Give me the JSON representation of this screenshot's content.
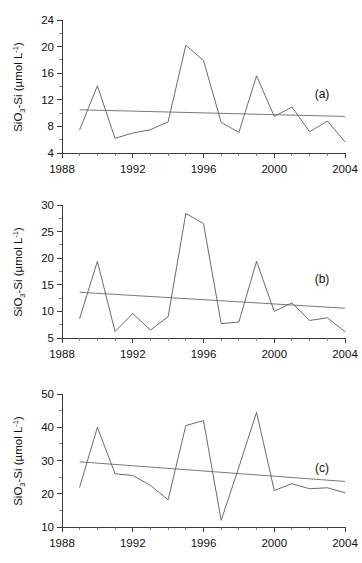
{
  "figure": {
    "background": "#ffffff",
    "line_color": "#5a5a5a",
    "trend_color": "#6a6a6a",
    "axis_color": "#3a3a3a"
  },
  "axis_title": {
    "prefix": "SiO",
    "subscript": "3",
    "middle": "-Si (µmol L",
    "superscript": "-1",
    "suffix": ")",
    "full": "SiO3-Si (µmol L-1)"
  },
  "chart_data": [
    {
      "type": "line",
      "panel": "(a)",
      "title": "",
      "xlabel": "",
      "ylabel": "SiO3-Si (µmol L-1)",
      "x": [
        1989,
        1990,
        1991,
        1992,
        1993,
        1994,
        1995,
        1996,
        1997,
        1998,
        1999,
        2000,
        2001,
        2002,
        2003,
        2004
      ],
      "values": [
        7.5,
        14.1,
        6.2,
        7.0,
        7.5,
        8.7,
        20.2,
        17.9,
        8.6,
        7.1,
        15.6,
        9.5,
        10.9,
        7.2,
        8.8,
        5.7
      ],
      "xlim": [
        1988,
        2004
      ],
      "ylim": [
        4,
        24
      ],
      "yticks": [
        4,
        8,
        12,
        16,
        20,
        24
      ],
      "xticks": [
        1988,
        1992,
        1996,
        2000,
        2004
      ],
      "xtick_labels": [
        "1988",
        "1992",
        "1996",
        "2000",
        "2004"
      ],
      "ytick_labels": [
        "4",
        "8",
        "12",
        "16",
        "20",
        "24"
      ],
      "grid": false,
      "legend": "none",
      "trend": {
        "x": [
          1989,
          2004
        ],
        "y": [
          10.5,
          9.5
        ]
      }
    },
    {
      "type": "line",
      "panel": "(b)",
      "title": "",
      "xlabel": "",
      "ylabel": "SiO3-Si (µmol L-1)",
      "x": [
        1989,
        1990,
        1991,
        1992,
        1993,
        1994,
        1995,
        1996,
        1997,
        1998,
        1999,
        2000,
        2001,
        2002,
        2003,
        2004
      ],
      "values": [
        8.7,
        19.4,
        6.2,
        9.6,
        6.5,
        9.0,
        28.4,
        26.5,
        7.7,
        8.0,
        19.4,
        10.0,
        11.6,
        8.3,
        8.8,
        6.2
      ],
      "xlim": [
        1988,
        2004
      ],
      "ylim": [
        5,
        30
      ],
      "yticks": [
        5,
        10,
        15,
        20,
        25,
        30
      ],
      "xticks": [
        1988,
        1992,
        1996,
        2000,
        2004
      ],
      "xtick_labels": [
        "1988",
        "1992",
        "1996",
        "2000",
        "2004"
      ],
      "ytick_labels": [
        "5",
        "10",
        "15",
        "20",
        "25",
        "30"
      ],
      "grid": false,
      "legend": "none",
      "trend": {
        "x": [
          1989,
          2004
        ],
        "y": [
          13.6,
          10.6
        ]
      }
    },
    {
      "type": "line",
      "panel": "(c)",
      "title": "",
      "xlabel": "",
      "ylabel": "SiO3-Si (µmol L-1)",
      "x": [
        1989,
        1990,
        1991,
        1992,
        1993,
        1994,
        1995,
        1996,
        1997,
        1998,
        1999,
        2000,
        2001,
        2002,
        2003,
        2004
      ],
      "values": [
        22.0,
        40.0,
        26.0,
        25.5,
        22.5,
        18.2,
        40.5,
        42.0,
        12.0,
        28.0,
        44.5,
        21.0,
        23.0,
        21.5,
        21.8,
        20.3
      ],
      "xlim": [
        1988,
        2004
      ],
      "ylim": [
        10,
        50
      ],
      "yticks": [
        10,
        20,
        30,
        40,
        50
      ],
      "xticks": [
        1988,
        1992,
        1996,
        2000,
        2004
      ],
      "xtick_labels": [
        "1988",
        "1992",
        "1996",
        "2000",
        "2004"
      ],
      "ytick_labels": [
        "10",
        "20",
        "30",
        "40",
        "50"
      ],
      "grid": false,
      "legend": "none",
      "trend": {
        "x": [
          1989,
          2004
        ],
        "y": [
          29.6,
          23.7
        ]
      }
    }
  ]
}
